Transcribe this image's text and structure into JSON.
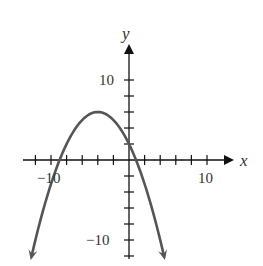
{
  "chart_data": {
    "type": "line",
    "title": "",
    "equation": "y = -1/4 (x + 4)^2 + 6",
    "xlabel": "x",
    "ylabel": "y",
    "xlim": [
      -13,
      14
    ],
    "ylim": [
      -13,
      15
    ],
    "x_tick_step": 2,
    "y_tick_step": 2,
    "x_tick_labels": [
      {
        "value": -10,
        "text": "−10"
      },
      {
        "value": 10,
        "text": "10"
      }
    ],
    "y_tick_labels": [
      {
        "value": 10,
        "text": "10"
      },
      {
        "value": -10,
        "text": "−10"
      }
    ],
    "grid": false,
    "legend": null,
    "series": [
      {
        "name": "parabola",
        "vertex": [
          -4,
          6
        ],
        "y_intercept": 2,
        "x_intercepts": [
          -8.9,
          0.9
        ],
        "x": [
          -12.5,
          -12,
          -10,
          -8,
          -6,
          -4,
          -2,
          0,
          2,
          4,
          4.5
        ],
        "y": [
          -12.06,
          -10,
          -3,
          2,
          5,
          6,
          5,
          2,
          -3,
          -10,
          -12.06
        ],
        "arrows_at_ends": true,
        "color": "#555555"
      }
    ]
  },
  "labels": {
    "x_axis": "x",
    "y_axis": "y",
    "x_neg10": "−10",
    "x_pos10": "10",
    "y_pos10": "10",
    "y_neg10": "−10"
  },
  "colors": {
    "axis": "#111111",
    "curve": "#555555",
    "text": "#333333"
  }
}
